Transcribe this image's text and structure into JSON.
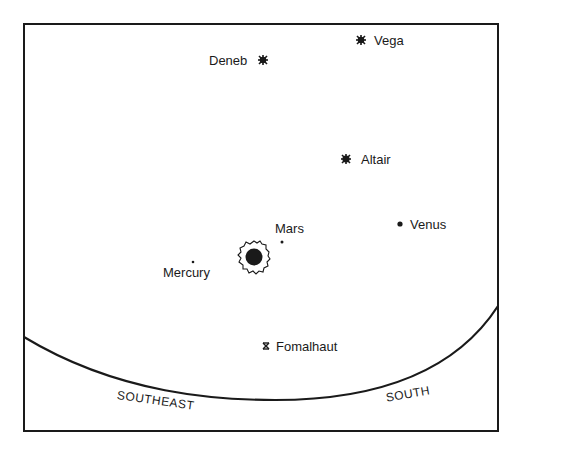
{
  "sky_chart": {
    "stars": [
      {
        "name": "Vega",
        "x": 361,
        "y": 40,
        "type": "bright-star"
      },
      {
        "name": "Deneb",
        "x": 263,
        "y": 60,
        "type": "bright-star"
      },
      {
        "name": "Altair",
        "x": 346,
        "y": 159,
        "type": "bright-star"
      },
      {
        "name": "Fomalhaut",
        "x": 266,
        "y": 346,
        "type": "star"
      }
    ],
    "planets": [
      {
        "name": "Venus",
        "x": 400,
        "y": 224
      },
      {
        "name": "Mars",
        "x": 282,
        "y": 242
      },
      {
        "name": "Mercury",
        "x": 193,
        "y": 262
      }
    ],
    "sun": {
      "name": "Sun",
      "x": 254,
      "y": 257
    },
    "horizon": {
      "labels": [
        {
          "text": "SOUTHEAST",
          "x": 118,
          "y": 388,
          "rotate": 8
        },
        {
          "text": "SOUTH",
          "x": 385,
          "y": 388,
          "rotate": -10
        }
      ]
    },
    "colors": {
      "ink": "#1a1a1a",
      "background": "#ffffff"
    }
  }
}
